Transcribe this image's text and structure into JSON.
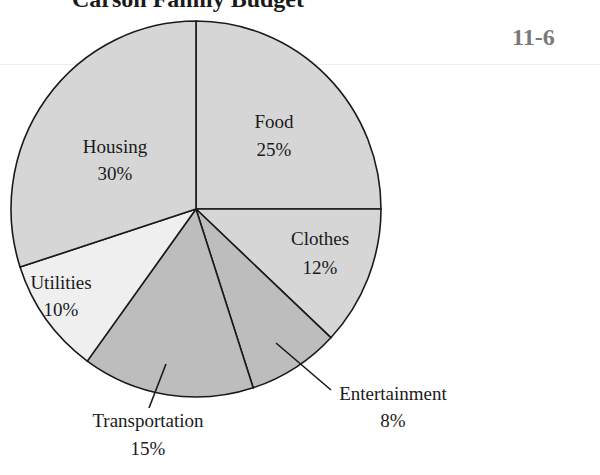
{
  "page": {
    "title": "Carson Family Budget",
    "section_number": "11-6"
  },
  "colors": {
    "light": "#d6d6d6",
    "dark": "#bdbdbd",
    "lightest": "#efefef",
    "outline": "#1a1a1a"
  },
  "chart_data": {
    "type": "pie",
    "title": "Carson Family Budget",
    "start_angle_deg": 0,
    "direction": "clockwise",
    "slices": [
      {
        "label": "Food",
        "value": 25,
        "display": "25%",
        "fill": "#d6d6d6"
      },
      {
        "label": "Clothes",
        "value": 12,
        "display": "12%",
        "fill": "#d6d6d6"
      },
      {
        "label": "Entertainment",
        "value": 8,
        "display": "8%",
        "fill": "#bdbdbd",
        "label_outside": true
      },
      {
        "label": "Transportation",
        "value": 15,
        "display": "15%",
        "fill": "#bdbdbd",
        "label_outside": true
      },
      {
        "label": "Utilities",
        "value": 10,
        "display": "10%",
        "fill": "#efefef"
      },
      {
        "label": "Housing",
        "value": 30,
        "display": "30%",
        "fill": "#d6d6d6"
      }
    ],
    "units": "percent",
    "legend": "none (labels on slices)"
  }
}
